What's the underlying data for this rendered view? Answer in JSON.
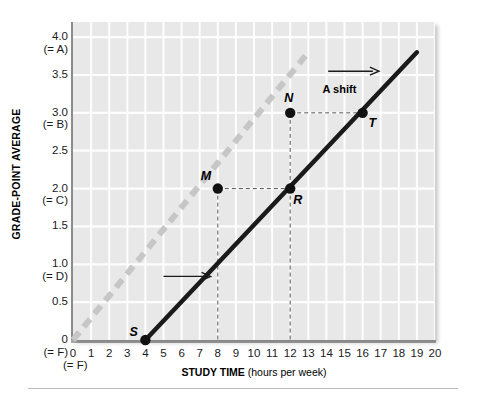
{
  "chart_data": {
    "type": "line",
    "title": "",
    "xlabel": "STUDY TIME (hours per week)",
    "xlabel_bold": "STUDY TIME",
    "xlabel_rest": " (hours per week)",
    "ylabel": "GRADE-POINT AVERAGE",
    "xlim": [
      0,
      20
    ],
    "ylim": [
      0,
      4.2
    ],
    "grid": true,
    "legend": "none",
    "x_ticks": [
      {
        "value": 0,
        "label": "0",
        "grade": "(= F)"
      },
      {
        "value": 1,
        "label": "1",
        "grade": ""
      },
      {
        "value": 2,
        "label": "2",
        "grade": ""
      },
      {
        "value": 3,
        "label": "3",
        "grade": ""
      },
      {
        "value": 4,
        "label": "4",
        "grade": ""
      },
      {
        "value": 5,
        "label": "5",
        "grade": ""
      },
      {
        "value": 6,
        "label": "6",
        "grade": ""
      },
      {
        "value": 7,
        "label": "7",
        "grade": ""
      },
      {
        "value": 8,
        "label": "8",
        "grade": ""
      },
      {
        "value": 9,
        "label": "9",
        "grade": ""
      },
      {
        "value": 10,
        "label": "10",
        "grade": ""
      },
      {
        "value": 11,
        "label": "11",
        "grade": ""
      },
      {
        "value": 12,
        "label": "12",
        "grade": ""
      },
      {
        "value": 13,
        "label": "13",
        "grade": ""
      },
      {
        "value": 14,
        "label": "14",
        "grade": ""
      },
      {
        "value": 15,
        "label": "15",
        "grade": ""
      },
      {
        "value": 16,
        "label": "16",
        "grade": ""
      },
      {
        "value": 17,
        "label": "17",
        "grade": ""
      },
      {
        "value": 18,
        "label": "18",
        "grade": ""
      },
      {
        "value": 19,
        "label": "19",
        "grade": ""
      },
      {
        "value": 20,
        "label": "20",
        "grade": ""
      }
    ],
    "y_ticks": [
      {
        "value": 4.0,
        "label": "4.0",
        "grade": "(= A)"
      },
      {
        "value": 3.5,
        "label": "3.5",
        "grade": ""
      },
      {
        "value": 3.0,
        "label": "3.0",
        "grade": "(= B)"
      },
      {
        "value": 2.5,
        "label": "2.5",
        "grade": ""
      },
      {
        "value": 2.0,
        "label": "2.0",
        "grade": "(= C)"
      },
      {
        "value": 1.5,
        "label": "1.5",
        "grade": ""
      },
      {
        "value": 1.0,
        "label": "1.0",
        "grade": "(= D)"
      },
      {
        "value": 0.5,
        "label": "0.5",
        "grade": ""
      },
      {
        "value": 0.0,
        "label": "0",
        "grade": "(= F)"
      }
    ],
    "series": [
      {
        "name": "original-line",
        "style": "dashed",
        "color": "#c6c6c6",
        "x": [
          0,
          13
        ],
        "y": [
          0.0,
          3.8
        ]
      },
      {
        "name": "shifted-line",
        "style": "solid",
        "color": "#1a1a1a",
        "x": [
          4,
          19
        ],
        "y": [
          0.0,
          3.8
        ]
      }
    ],
    "points": [
      {
        "label": "S",
        "x": 4,
        "y": 0.0,
        "line": "shifted-line"
      },
      {
        "label": "M",
        "x": 8,
        "y": 2.0,
        "line": "original-line"
      },
      {
        "label": "N",
        "x": 12,
        "y": 3.0,
        "line": "original-line"
      },
      {
        "label": "R",
        "x": 12,
        "y": 2.0,
        "line": "shifted-line"
      },
      {
        "label": "T",
        "x": 16,
        "y": 3.0,
        "line": "shifted-line"
      }
    ],
    "annotations": [
      {
        "name": "a-shift-label",
        "text": "A shift",
        "x": 15.0,
        "y": 3.3
      },
      {
        "name": "a-shift-arrow",
        "text": "",
        "x_from": 14.1,
        "x_to": 16.9,
        "y": 3.55
      },
      {
        "name": "lower-shift-arrow",
        "text": "",
        "x_from": 5.0,
        "x_to": 7.6,
        "y": 0.84
      }
    ],
    "guides": [
      {
        "name": "m-to-r-horizontal",
        "from": [
          8,
          2.0
        ],
        "to": [
          12,
          2.0
        ]
      },
      {
        "name": "n-to-t-horizontal",
        "from": [
          12,
          3.0
        ],
        "to": [
          16,
          3.0
        ]
      },
      {
        "name": "n-to-r-vertical",
        "from": [
          12,
          3.0
        ],
        "to": [
          12,
          2.0
        ]
      },
      {
        "name": "m-drop-vertical",
        "from": [
          8,
          2.0
        ],
        "to": [
          8,
          0.0
        ]
      },
      {
        "name": "r-drop-vertical",
        "from": [
          12,
          2.0
        ],
        "to": [
          12,
          0.0
        ]
      }
    ],
    "colors": {
      "plot_background": "#e8e8e8",
      "gridline": "#fdfdfd",
      "solid_line": "#1a1a1a",
      "dashed_line": "#c6c6c6",
      "point_fill": "#111111",
      "guide_line": "#555555"
    }
  }
}
